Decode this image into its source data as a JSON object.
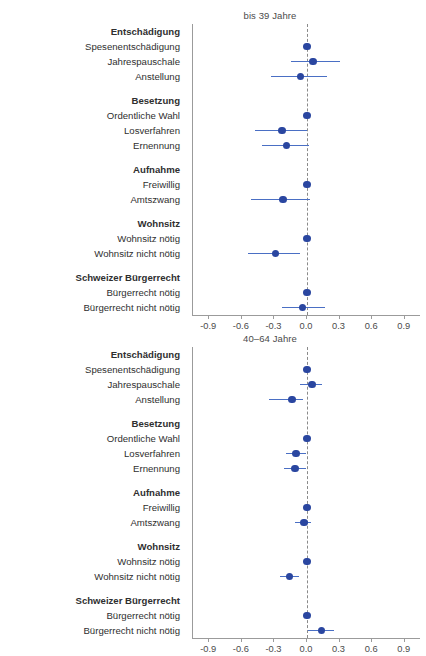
{
  "top_caption": "",
  "colors": {
    "dot": "#2a46a0",
    "bar": "#4a6fc4",
    "axis": "#9b9b9b",
    "zeroline": "#8a8a8a",
    "text": "#2f2f2f"
  },
  "axis": {
    "ticks": [
      -0.9,
      -0.6,
      -0.3,
      0.0,
      0.3,
      0.6,
      0.9
    ],
    "tick_labels": [
      "-0.9",
      "-0.6",
      "-0.3",
      "0.0",
      "0.3",
      "0.6",
      "0.9"
    ],
    "xlim": [
      -1.05,
      1.05
    ]
  },
  "row_labels": [
    {
      "text": "Entschädigung",
      "type": "head"
    },
    {
      "text": "Spesenentschädigung",
      "type": "item"
    },
    {
      "text": "Jahrespauschale",
      "type": "item"
    },
    {
      "text": "Anstellung",
      "type": "item"
    },
    {
      "text": "",
      "type": "gap"
    },
    {
      "text": "Besetzung",
      "type": "head"
    },
    {
      "text": "Ordentliche Wahl",
      "type": "item"
    },
    {
      "text": "Losverfahren",
      "type": "item"
    },
    {
      "text": "Ernennung",
      "type": "item"
    },
    {
      "text": "",
      "type": "gap"
    },
    {
      "text": "Aufnahme",
      "type": "head"
    },
    {
      "text": "Freiwillig",
      "type": "item"
    },
    {
      "text": "Amtszwang",
      "type": "item"
    },
    {
      "text": "",
      "type": "gap"
    },
    {
      "text": "Wohnsitz",
      "type": "head"
    },
    {
      "text": "Wohnsitz nötig",
      "type": "item"
    },
    {
      "text": "Wohnsitz nicht nötig",
      "type": "item"
    },
    {
      "text": "",
      "type": "gap"
    },
    {
      "text": "Schweizer Bürgerrecht",
      "type": "head"
    },
    {
      "text": "Bürgerrecht nötig",
      "type": "item"
    },
    {
      "text": "Bürgerrecht nicht nötig",
      "type": "item"
    }
  ],
  "charts": [
    {
      "id": "chart-bis-39",
      "title": "bis 39 Jahre",
      "points": [
        {
          "label": "Spesenentschädigung",
          "x": 0.0,
          "lo": 0.0,
          "hi": 0.0
        },
        {
          "label": "Jahrespauschale",
          "x": 0.055,
          "lo": -0.15,
          "hi": 0.3
        },
        {
          "label": "Anstellung",
          "x": -0.06,
          "lo": -0.33,
          "hi": 0.18
        },
        {
          "label": "Ordentliche Wahl",
          "x": 0.0,
          "lo": 0.0,
          "hi": 0.0
        },
        {
          "label": "Losverfahren",
          "x": -0.23,
          "lo": -0.48,
          "hi": 0.0
        },
        {
          "label": "Ernennung",
          "x": -0.19,
          "lo": -0.41,
          "hi": 0.02
        },
        {
          "label": "Freiwillig",
          "x": 0.0,
          "lo": 0.0,
          "hi": 0.0
        },
        {
          "label": "Amtszwang",
          "x": -0.22,
          "lo": -0.52,
          "hi": 0.03
        },
        {
          "label": "Wohnsitz nötig",
          "x": 0.0,
          "lo": 0.0,
          "hi": 0.0
        },
        {
          "label": "Wohnsitz nicht nötig",
          "x": -0.29,
          "lo": -0.54,
          "hi": -0.06
        },
        {
          "label": "Bürgerrecht nötig",
          "x": 0.0,
          "lo": 0.0,
          "hi": 0.0
        },
        {
          "label": "Bürgerrecht nicht nötig",
          "x": -0.04,
          "lo": -0.23,
          "hi": 0.17
        }
      ]
    },
    {
      "id": "chart-40-64",
      "title": "40–64 Jahre",
      "points": [
        {
          "label": "Spesenentschädigung",
          "x": 0.0,
          "lo": 0.0,
          "hi": 0.0
        },
        {
          "label": "Jahrespauschale",
          "x": 0.045,
          "lo": -0.06,
          "hi": 0.14
        },
        {
          "label": "Anstellung",
          "x": -0.14,
          "lo": -0.35,
          "hi": -0.04
        },
        {
          "label": "Ordentliche Wahl",
          "x": 0.0,
          "lo": 0.0,
          "hi": 0.0
        },
        {
          "label": "Losverfahren",
          "x": -0.1,
          "lo": -0.19,
          "hi": -0.01
        },
        {
          "label": "Ernennung",
          "x": -0.11,
          "lo": -0.21,
          "hi": -0.01
        },
        {
          "label": "Freiwillig",
          "x": 0.0,
          "lo": 0.0,
          "hi": 0.0
        },
        {
          "label": "Amtszwang",
          "x": -0.03,
          "lo": -0.11,
          "hi": 0.04
        },
        {
          "label": "Wohnsitz nötig",
          "x": 0.0,
          "lo": 0.0,
          "hi": 0.0
        },
        {
          "label": "Wohnsitz nicht nötig",
          "x": -0.16,
          "lo": -0.25,
          "hi": -0.07
        },
        {
          "label": "Bürgerrecht nötig",
          "x": 0.0,
          "lo": 0.0,
          "hi": 0.0
        },
        {
          "label": "Bürgerrecht nicht nötig",
          "x": 0.135,
          "lo": 0.01,
          "hi": 0.25
        }
      ]
    }
  ],
  "chart_data": {
    "type": "scatter",
    "subcharts": [
      "bis 39 Jahre",
      "40–64 Jahre"
    ],
    "xlabel": "",
    "ylabel": "",
    "xlim": [
      -1.05,
      1.05
    ],
    "xticks": [
      -0.9,
      -0.6,
      -0.3,
      0.0,
      0.3,
      0.6,
      0.9
    ],
    "grid": false,
    "legend": "none",
    "reference_line": 0.0,
    "categories": [
      "Spesenentschädigung",
      "Jahrespauschale",
      "Anstellung",
      "Ordentliche Wahl",
      "Losverfahren",
      "Ernennung",
      "Freiwillig",
      "Amtszwang",
      "Wohnsitz nötig",
      "Wohnsitz nicht nötig",
      "Bürgerrecht nötig",
      "Bürgerrecht nicht nötig"
    ],
    "groups": [
      "Entschädigung",
      "Besetzung",
      "Aufnahme",
      "Wohnsitz",
      "Schweizer Bürgerrecht"
    ],
    "series": [
      {
        "name": "bis 39 Jahre",
        "values": [
          0.0,
          0.055,
          -0.06,
          0.0,
          -0.23,
          -0.19,
          0.0,
          -0.22,
          0.0,
          -0.29,
          0.0,
          -0.04
        ],
        "ci_low": [
          0.0,
          -0.15,
          -0.33,
          0.0,
          -0.48,
          -0.41,
          0.0,
          -0.52,
          0.0,
          -0.54,
          0.0,
          -0.23
        ],
        "ci_high": [
          0.0,
          0.3,
          0.18,
          0.0,
          0.0,
          0.02,
          0.0,
          0.03,
          0.0,
          -0.06,
          0.0,
          0.17
        ]
      },
      {
        "name": "40–64 Jahre",
        "values": [
          0.0,
          0.045,
          -0.14,
          0.0,
          -0.1,
          -0.11,
          0.0,
          -0.03,
          0.0,
          -0.16,
          0.0,
          0.135
        ],
        "ci_low": [
          0.0,
          -0.06,
          -0.35,
          0.0,
          -0.19,
          -0.21,
          0.0,
          -0.11,
          0.0,
          -0.25,
          0.0,
          0.01
        ],
        "ci_high": [
          0.0,
          0.14,
          -0.04,
          0.0,
          -0.01,
          -0.01,
          0.0,
          0.04,
          0.0,
          -0.07,
          0.0,
          0.25
        ]
      }
    ]
  }
}
